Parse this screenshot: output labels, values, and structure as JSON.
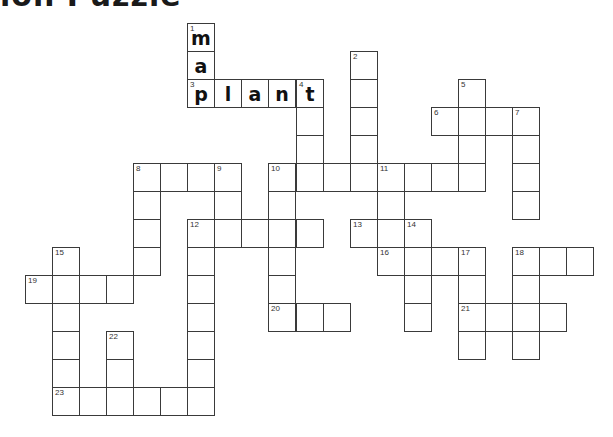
{
  "page": {
    "title": "ion Puzzle"
  },
  "grid": {
    "origin_x": 25,
    "origin_y": 23,
    "cell_width": 27.05,
    "cell_height": 28,
    "border_color": "#3a3a3a"
  },
  "cells": [
    {
      "c": 6,
      "r": 0,
      "n": "1",
      "l": "m"
    },
    {
      "c": 6,
      "r": 1,
      "n": "",
      "l": "a"
    },
    {
      "c": 12,
      "r": 1,
      "n": "2",
      "l": ""
    },
    {
      "c": 6,
      "r": 2,
      "n": "3",
      "l": "p"
    },
    {
      "c": 7,
      "r": 2,
      "n": "",
      "l": "l"
    },
    {
      "c": 8,
      "r": 2,
      "n": "",
      "l": "a"
    },
    {
      "c": 9,
      "r": 2,
      "n": "",
      "l": "n"
    },
    {
      "c": 10,
      "r": 2,
      "n": "4",
      "l": "t"
    },
    {
      "c": 12,
      "r": 2,
      "n": "",
      "l": ""
    },
    {
      "c": 16,
      "r": 2,
      "n": "5",
      "l": ""
    },
    {
      "c": 10,
      "r": 3,
      "n": "",
      "l": ""
    },
    {
      "c": 12,
      "r": 3,
      "n": "",
      "l": ""
    },
    {
      "c": 15,
      "r": 3,
      "n": "6",
      "l": ""
    },
    {
      "c": 16,
      "r": 3,
      "n": "",
      "l": ""
    },
    {
      "c": 17,
      "r": 3,
      "n": "",
      "l": ""
    },
    {
      "c": 18,
      "r": 3,
      "n": "7",
      "l": ""
    },
    {
      "c": 10,
      "r": 4,
      "n": "",
      "l": ""
    },
    {
      "c": 12,
      "r": 4,
      "n": "",
      "l": ""
    },
    {
      "c": 16,
      "r": 4,
      "n": "",
      "l": ""
    },
    {
      "c": 18,
      "r": 4,
      "n": "",
      "l": ""
    },
    {
      "c": 4,
      "r": 5,
      "n": "8",
      "l": ""
    },
    {
      "c": 5,
      "r": 5,
      "n": "",
      "l": ""
    },
    {
      "c": 6,
      "r": 5,
      "n": "",
      "l": ""
    },
    {
      "c": 7,
      "r": 5,
      "n": "9",
      "l": ""
    },
    {
      "c": 9,
      "r": 5,
      "n": "10",
      "l": ""
    },
    {
      "c": 10,
      "r": 5,
      "n": "",
      "l": ""
    },
    {
      "c": 11,
      "r": 5,
      "n": "",
      "l": ""
    },
    {
      "c": 12,
      "r": 5,
      "n": "",
      "l": ""
    },
    {
      "c": 13,
      "r": 5,
      "n": "11",
      "l": ""
    },
    {
      "c": 14,
      "r": 5,
      "n": "",
      "l": ""
    },
    {
      "c": 15,
      "r": 5,
      "n": "",
      "l": ""
    },
    {
      "c": 16,
      "r": 5,
      "n": "",
      "l": ""
    },
    {
      "c": 18,
      "r": 5,
      "n": "",
      "l": ""
    },
    {
      "c": 4,
      "r": 6,
      "n": "",
      "l": ""
    },
    {
      "c": 7,
      "r": 6,
      "n": "",
      "l": ""
    },
    {
      "c": 9,
      "r": 6,
      "n": "",
      "l": ""
    },
    {
      "c": 13,
      "r": 6,
      "n": "",
      "l": ""
    },
    {
      "c": 18,
      "r": 6,
      "n": "",
      "l": ""
    },
    {
      "c": 4,
      "r": 7,
      "n": "",
      "l": ""
    },
    {
      "c": 6,
      "r": 7,
      "n": "12",
      "l": ""
    },
    {
      "c": 7,
      "r": 7,
      "n": "",
      "l": ""
    },
    {
      "c": 8,
      "r": 7,
      "n": "",
      "l": ""
    },
    {
      "c": 9,
      "r": 7,
      "n": "",
      "l": ""
    },
    {
      "c": 10,
      "r": 7,
      "n": "",
      "l": ""
    },
    {
      "c": 12,
      "r": 7,
      "n": "13",
      "l": ""
    },
    {
      "c": 13,
      "r": 7,
      "n": "",
      "l": ""
    },
    {
      "c": 14,
      "r": 7,
      "n": "14",
      "l": ""
    },
    {
      "c": 1,
      "r": 8,
      "n": "15",
      "l": ""
    },
    {
      "c": 4,
      "r": 8,
      "n": "",
      "l": ""
    },
    {
      "c": 6,
      "r": 8,
      "n": "",
      "l": ""
    },
    {
      "c": 9,
      "r": 8,
      "n": "",
      "l": ""
    },
    {
      "c": 13,
      "r": 8,
      "n": "16",
      "l": ""
    },
    {
      "c": 14,
      "r": 8,
      "n": "",
      "l": ""
    },
    {
      "c": 15,
      "r": 8,
      "n": "",
      "l": ""
    },
    {
      "c": 16,
      "r": 8,
      "n": "17",
      "l": ""
    },
    {
      "c": 18,
      "r": 8,
      "n": "18",
      "l": ""
    },
    {
      "c": 19,
      "r": 8,
      "n": "",
      "l": ""
    },
    {
      "c": 20,
      "r": 8,
      "n": "",
      "l": ""
    },
    {
      "c": 0,
      "r": 9,
      "n": "19",
      "l": ""
    },
    {
      "c": 1,
      "r": 9,
      "n": "",
      "l": ""
    },
    {
      "c": 2,
      "r": 9,
      "n": "",
      "l": ""
    },
    {
      "c": 3,
      "r": 9,
      "n": "",
      "l": ""
    },
    {
      "c": 6,
      "r": 9,
      "n": "",
      "l": ""
    },
    {
      "c": 9,
      "r": 9,
      "n": "",
      "l": ""
    },
    {
      "c": 14,
      "r": 9,
      "n": "",
      "l": ""
    },
    {
      "c": 16,
      "r": 9,
      "n": "",
      "l": ""
    },
    {
      "c": 18,
      "r": 9,
      "n": "",
      "l": ""
    },
    {
      "c": 1,
      "r": 10,
      "n": "",
      "l": ""
    },
    {
      "c": 6,
      "r": 10,
      "n": "",
      "l": ""
    },
    {
      "c": 9,
      "r": 10,
      "n": "20",
      "l": ""
    },
    {
      "c": 10,
      "r": 10,
      "n": "",
      "l": ""
    },
    {
      "c": 11,
      "r": 10,
      "n": "",
      "l": ""
    },
    {
      "c": 14,
      "r": 10,
      "n": "",
      "l": ""
    },
    {
      "c": 16,
      "r": 10,
      "n": "21",
      "l": ""
    },
    {
      "c": 17,
      "r": 10,
      "n": "",
      "l": ""
    },
    {
      "c": 18,
      "r": 10,
      "n": "",
      "l": ""
    },
    {
      "c": 19,
      "r": 10,
      "n": "",
      "l": ""
    },
    {
      "c": 1,
      "r": 11,
      "n": "",
      "l": ""
    },
    {
      "c": 3,
      "r": 11,
      "n": "22",
      "l": ""
    },
    {
      "c": 6,
      "r": 11,
      "n": "",
      "l": ""
    },
    {
      "c": 16,
      "r": 11,
      "n": "",
      "l": ""
    },
    {
      "c": 18,
      "r": 11,
      "n": "",
      "l": ""
    },
    {
      "c": 1,
      "r": 12,
      "n": "",
      "l": ""
    },
    {
      "c": 3,
      "r": 12,
      "n": "",
      "l": ""
    },
    {
      "c": 6,
      "r": 12,
      "n": "",
      "l": ""
    },
    {
      "c": 1,
      "r": 13,
      "n": "23",
      "l": ""
    },
    {
      "c": 2,
      "r": 13,
      "n": "",
      "l": ""
    },
    {
      "c": 3,
      "r": 13,
      "n": "",
      "l": ""
    },
    {
      "c": 4,
      "r": 13,
      "n": "",
      "l": ""
    },
    {
      "c": 5,
      "r": 13,
      "n": "",
      "l": ""
    },
    {
      "c": 6,
      "r": 13,
      "n": "",
      "l": ""
    }
  ],
  "entries": {
    "across": [
      "3",
      "6",
      "8",
      "10",
      "12",
      "13",
      "16",
      "18",
      "19",
      "20",
      "21",
      "23"
    ],
    "down": [
      "1",
      "2",
      "4",
      "5",
      "7",
      "8",
      "9",
      "10",
      "11",
      "12",
      "14",
      "15",
      "17",
      "18",
      "22"
    ]
  },
  "filled_words": [
    {
      "number": "1",
      "direction": "down",
      "partial": "map"
    },
    {
      "number": "3",
      "direction": "across",
      "answer": "plant"
    }
  ]
}
